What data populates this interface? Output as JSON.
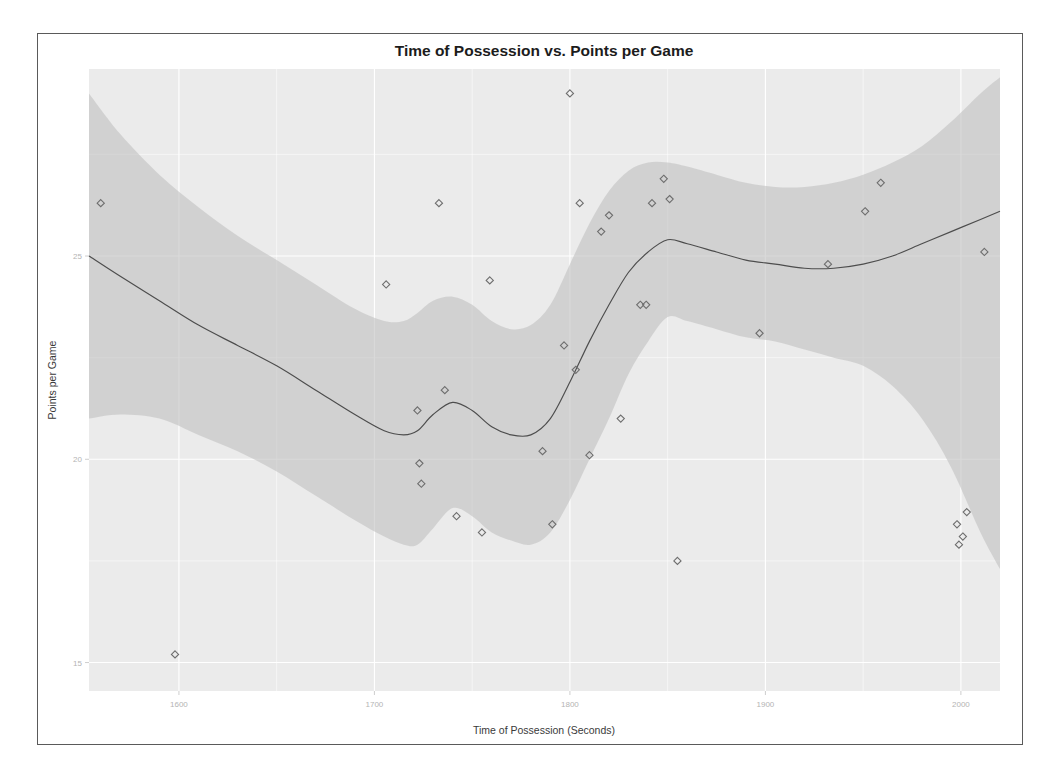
{
  "figure": {
    "title": "Time of Possession vs. Points per Game",
    "xlabel": "Time of Possession (Seconds)",
    "ylabel": "Points per Game"
  },
  "chart_data": {
    "type": "scatter",
    "title": "Time of Possession vs. Points per Game",
    "xlabel": "Time of Possession (Seconds)",
    "ylabel": "Points per Game",
    "xlim": [
      1554,
      2020
    ],
    "ylim": [
      14.3,
      29.6
    ],
    "xticks": [
      1600,
      1700,
      1800,
      1900,
      2000
    ],
    "xtick_labels": [
      "1600",
      "1700",
      "1800",
      "1900",
      "2000"
    ],
    "yticks": [
      15,
      20,
      25,
      30,
      35
    ],
    "ytick_labels": [
      "15",
      "20",
      "25",
      "30",
      "35"
    ],
    "grid": true,
    "legend": false,
    "marker": "open-diamond",
    "points": [
      {
        "x": 1560,
        "y": 26.3
      },
      {
        "x": 1598,
        "y": 15.2
      },
      {
        "x": 1706,
        "y": 24.3
      },
      {
        "x": 1722,
        "y": 21.2
      },
      {
        "x": 1723,
        "y": 19.9
      },
      {
        "x": 1724,
        "y": 19.4
      },
      {
        "x": 1733,
        "y": 26.3
      },
      {
        "x": 1736,
        "y": 21.7
      },
      {
        "x": 1742,
        "y": 18.6
      },
      {
        "x": 1755,
        "y": 18.2
      },
      {
        "x": 1759,
        "y": 24.4
      },
      {
        "x": 1786,
        "y": 20.2
      },
      {
        "x": 1791,
        "y": 18.4
      },
      {
        "x": 1797,
        "y": 22.8
      },
      {
        "x": 1800,
        "y": 29.0
      },
      {
        "x": 1803,
        "y": 22.2
      },
      {
        "x": 1805,
        "y": 26.3
      },
      {
        "x": 1810,
        "y": 20.1
      },
      {
        "x": 1816,
        "y": 25.6
      },
      {
        "x": 1820,
        "y": 26.0
      },
      {
        "x": 1826,
        "y": 21.0
      },
      {
        "x": 1836,
        "y": 23.8
      },
      {
        "x": 1839,
        "y": 23.8
      },
      {
        "x": 1842,
        "y": 26.3
      },
      {
        "x": 1848,
        "y": 26.9
      },
      {
        "x": 1851,
        "y": 26.4
      },
      {
        "x": 1855,
        "y": 17.5
      },
      {
        "x": 1897,
        "y": 23.1
      },
      {
        "x": 1932,
        "y": 24.8
      },
      {
        "x": 1951,
        "y": 26.1
      },
      {
        "x": 1959,
        "y": 26.8
      },
      {
        "x": 2012,
        "y": 25.1
      },
      {
        "x": 1998,
        "y": 18.4
      },
      {
        "x": 2001,
        "y": 18.1
      },
      {
        "x": 2003,
        "y": 18.7
      },
      {
        "x": 1999,
        "y": 17.9
      }
    ],
    "trend": {
      "name": "loess-fit",
      "x": [
        1554,
        1570,
        1590,
        1610,
        1630,
        1650,
        1670,
        1690,
        1705,
        1715,
        1722,
        1730,
        1740,
        1750,
        1760,
        1770,
        1780,
        1790,
        1800,
        1810,
        1820,
        1830,
        1840,
        1850,
        1860,
        1875,
        1890,
        1905,
        1920,
        1935,
        1950,
        1965,
        1980,
        1995,
        2010,
        2020
      ],
      "y": [
        25.0,
        24.5,
        23.9,
        23.3,
        22.8,
        22.3,
        21.7,
        21.1,
        20.7,
        20.6,
        20.7,
        21.1,
        21.4,
        21.2,
        20.8,
        20.6,
        20.6,
        21.0,
        21.9,
        22.9,
        23.8,
        24.6,
        25.1,
        25.4,
        25.3,
        25.1,
        24.9,
        24.8,
        24.7,
        24.7,
        24.8,
        25.0,
        25.3,
        25.6,
        25.9,
        26.1
      ]
    },
    "confidence_band": {
      "x": [
        1554,
        1570,
        1590,
        1610,
        1630,
        1650,
        1670,
        1690,
        1705,
        1715,
        1722,
        1730,
        1740,
        1750,
        1760,
        1770,
        1780,
        1790,
        1800,
        1810,
        1820,
        1830,
        1840,
        1850,
        1860,
        1875,
        1890,
        1905,
        1920,
        1935,
        1950,
        1965,
        1980,
        1995,
        2010,
        2020
      ],
      "upper": [
        29.0,
        28.0,
        27.0,
        26.2,
        25.5,
        24.9,
        24.3,
        23.7,
        23.4,
        23.4,
        23.6,
        23.9,
        24.0,
        23.8,
        23.4,
        23.2,
        23.3,
        23.8,
        24.8,
        25.8,
        26.6,
        27.1,
        27.3,
        27.3,
        27.2,
        27.0,
        26.8,
        26.7,
        26.7,
        26.8,
        27.0,
        27.3,
        27.7,
        28.3,
        29.0,
        29.4
      ],
      "lower": [
        21.0,
        21.1,
        21.0,
        20.6,
        20.2,
        19.7,
        19.1,
        18.5,
        18.1,
        17.9,
        17.9,
        18.3,
        18.8,
        18.6,
        18.2,
        18.0,
        17.9,
        18.2,
        19.0,
        20.0,
        21.0,
        22.1,
        22.9,
        23.5,
        23.4,
        23.2,
        23.0,
        22.9,
        22.7,
        22.5,
        22.3,
        21.8,
        21.0,
        19.8,
        18.2,
        17.3
      ]
    }
  }
}
